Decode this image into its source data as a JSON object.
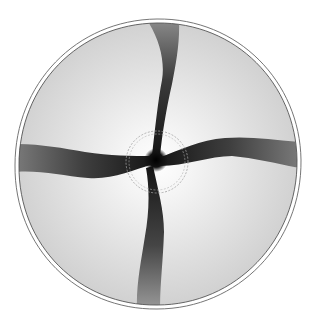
{
  "figure": {
    "canvas": {
      "width": 310,
      "height": 327,
      "background": "#ffffff"
    },
    "domain": {
      "center": [
        157,
        163
      ],
      "outer_radius_x": 140,
      "outer_radius_y": 143,
      "fill_edge": "#d4d4d4",
      "fill_center": "#ffffff",
      "outline_color": "#555555",
      "outline_count": 2,
      "outline_gap": 4
    },
    "inner_circle": {
      "center": [
        157,
        162
      ],
      "radius": 30,
      "style": "dashed double",
      "color": "#9a9a9a"
    },
    "core": {
      "center": [
        156,
        160
      ],
      "radius": 7,
      "color": "#111111"
    },
    "arms": [
      {
        "name": "top-arm",
        "direction": "up",
        "color_tip": "#7a7a7a",
        "color_base": "#1a1a1a"
      },
      {
        "name": "right-arm",
        "direction": "right",
        "color_tip": "#6a6a6a",
        "color_base": "#1a1a1a"
      },
      {
        "name": "bottom-arm",
        "direction": "down",
        "color_tip": "#8a8a8a",
        "color_base": "#1a1a1a"
      },
      {
        "name": "left-arm",
        "direction": "left",
        "color_tip": "#6a6a6a",
        "color_base": "#1a1a1a"
      }
    ]
  }
}
